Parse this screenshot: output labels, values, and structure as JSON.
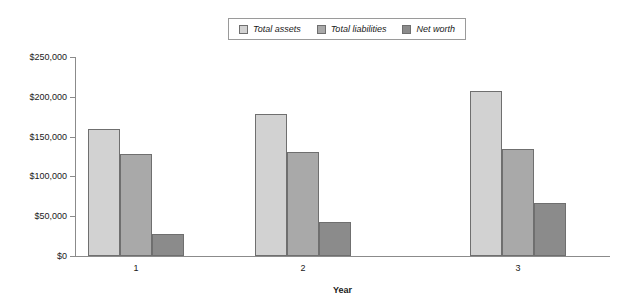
{
  "chart_data": {
    "type": "bar",
    "title": "",
    "subtitle": "",
    "xlabel": "Year",
    "ylabel": "",
    "categories": [
      "1",
      "2",
      "3"
    ],
    "series": [
      {
        "name": "Total assets",
        "color": "#d2d2d2",
        "values": [
          160000,
          178000,
          207000
        ]
      },
      {
        "name": "Total liabilities",
        "color": "#a9a9a9",
        "values": [
          128000,
          131000,
          135000
        ]
      },
      {
        "name": "Net worth",
        "color": "#8b8b8b",
        "values": [
          28000,
          43000,
          67000
        ]
      }
    ],
    "ylim": [
      0,
      250000
    ],
    "ytick_values": [
      0,
      50000,
      100000,
      150000,
      200000,
      250000
    ],
    "ytick_labels": [
      "$0",
      "$50,000",
      "$100,000",
      "$150,000",
      "$200,000",
      "$250,000"
    ],
    "xtick_labels": [
      "1",
      "2",
      "3"
    ],
    "grid": false,
    "legend_position": "top-center",
    "legend_entries": [
      "Total assets",
      "Total liabilities",
      "Net worth"
    ],
    "annotations": []
  },
  "axes": {
    "x_title": "Year",
    "y_title": ""
  },
  "colors": {
    "total_assets": "#d2d2d2",
    "total_liabilities": "#a9a9a9",
    "net_worth": "#8b8b8b",
    "bar_border": "#6f6f6f",
    "axis": "#8b8b8b",
    "text": "#1a1a1a",
    "background": "#ffffff"
  }
}
